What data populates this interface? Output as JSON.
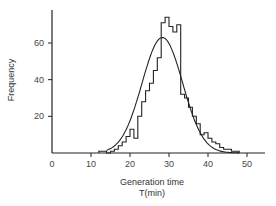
{
  "chart_data": {
    "type": "bar",
    "subtype": "histogram_with_normal_fit",
    "title": "",
    "xlabel": "Generation time",
    "xlabel_units": "T(min)",
    "ylabel": "Frequency",
    "xlim": [
      0,
      55
    ],
    "ylim": [
      0,
      77
    ],
    "xticks": [
      0,
      10,
      20,
      30,
      40,
      50
    ],
    "yticks": [
      20,
      40,
      60
    ],
    "grid": false,
    "legend": null,
    "bin_width": 1,
    "bins": [
      12,
      13,
      14,
      15,
      16,
      17,
      18,
      19,
      20,
      21,
      22,
      23,
      24,
      25,
      26,
      27,
      28,
      29,
      30,
      31,
      32,
      33,
      34,
      35,
      36,
      37,
      38,
      39,
      40,
      41,
      42,
      43,
      44,
      45,
      46,
      47
    ],
    "values": [
      1,
      1,
      0,
      1,
      2,
      4,
      6,
      9,
      13,
      8,
      20,
      28,
      34,
      38,
      45,
      52,
      71,
      74,
      69,
      66,
      70,
      32,
      30,
      25,
      20,
      16,
      10,
      11,
      8,
      6,
      5,
      3,
      2,
      2,
      1,
      1
    ],
    "series": [
      {
        "name": "Observed",
        "type": "histogram"
      },
      {
        "name": "Normal fit",
        "type": "line",
        "mean": 28.3,
        "peak": 63,
        "sd": 5.2
      }
    ]
  },
  "labels": {
    "ylabel": "Frequency",
    "xlabel_line1": "Generation time",
    "xlabel_line2": "T(min)",
    "xtick_labels": [
      "0",
      "10",
      "20",
      "30",
      "40",
      "50"
    ],
    "ytick_labels": [
      "20",
      "40",
      "60"
    ]
  }
}
